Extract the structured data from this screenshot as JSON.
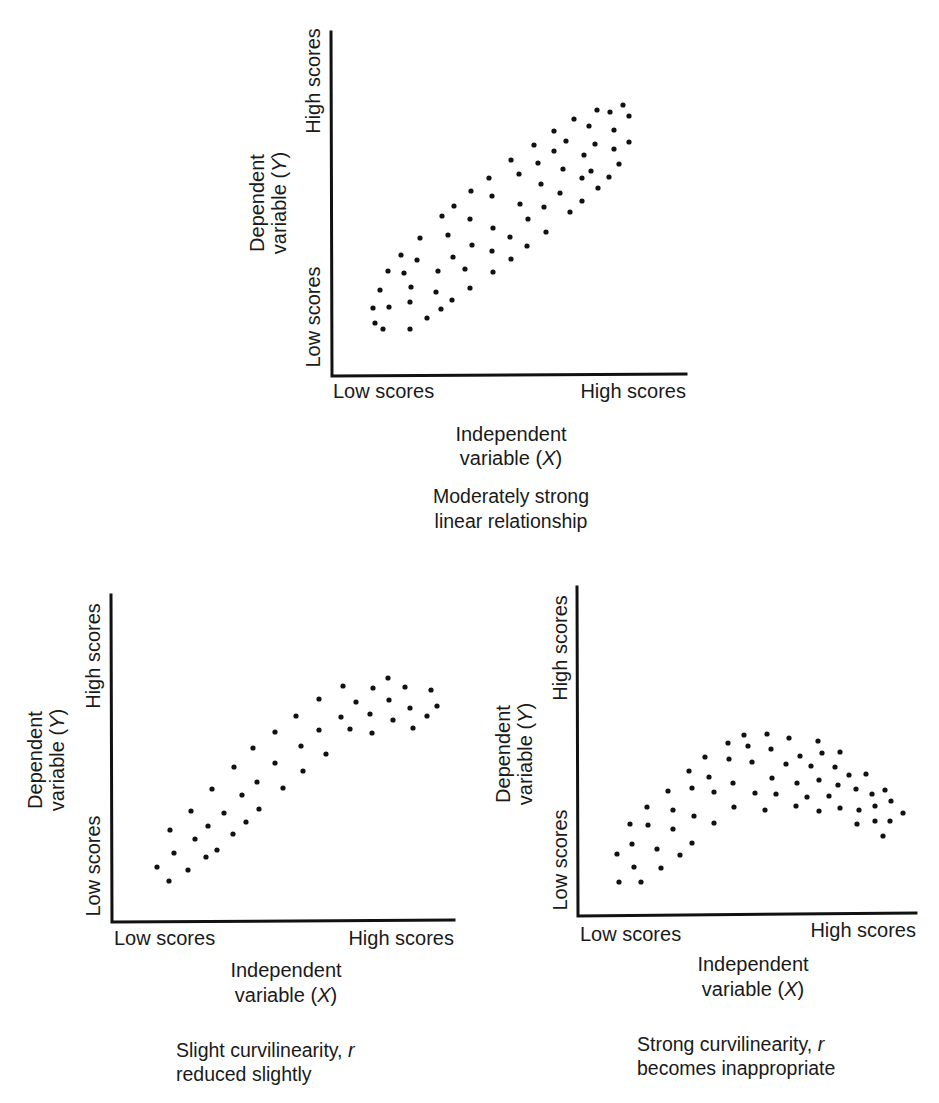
{
  "figure": {
    "panels": [
      {
        "id": "top",
        "caption_lines": [
          "Moderately strong",
          "linear relationship"
        ],
        "x_title_lines": [
          "Independent",
          "variable (",
          "X",
          ")"
        ],
        "y_title_lines": [
          "Dependent",
          "variable (",
          "Y",
          ")"
        ],
        "x_low": "Low scores",
        "x_high": "High scores",
        "y_low": "Low scores",
        "y_high": "High scores"
      },
      {
        "id": "bottom-left",
        "caption_lines": [
          "Slight curvilinearity, ",
          "r",
          "reduced slightly"
        ],
        "x_title_lines": [
          "Independent",
          "variable (",
          "X",
          ")"
        ],
        "y_title_lines": [
          "Dependent",
          "variable (",
          "Y",
          ")"
        ],
        "x_low": "Low scores",
        "x_high": "High scores",
        "y_low": "Low scores",
        "y_high": "High scores"
      },
      {
        "id": "bottom-right",
        "caption_lines": [
          "Strong curvilinearity, ",
          "r",
          "becomes inappropriate"
        ],
        "x_title_lines": [
          "Independent",
          "variable (",
          "X",
          ")"
        ],
        "y_title_lines": [
          "Dependent",
          "variable (",
          "Y",
          ")"
        ],
        "x_low": "Low scores",
        "x_high": "High scores",
        "y_low": "Low scores",
        "y_high": "High scores"
      }
    ]
  },
  "chart_data": [
    {
      "type": "scatter",
      "title": "Moderately strong linear relationship",
      "xlabel": "Independent variable (X)",
      "ylabel": "Dependent variable (Y)",
      "x_ticks": [
        "Low scores",
        "High scores"
      ],
      "y_ticks": [
        "Low scores",
        "High scores"
      ],
      "grid": false,
      "frame_px": {
        "x0": 331,
        "y0": 376,
        "x1": 686,
        "y1": 31
      },
      "points_px": [
        [
          373,
          308
        ],
        [
          375,
          323
        ],
        [
          383,
          329
        ],
        [
          380,
          290
        ],
        [
          389,
          307
        ],
        [
          388,
          271
        ],
        [
          401,
          255
        ],
        [
          404,
          273
        ],
        [
          411,
          287
        ],
        [
          410,
          302
        ],
        [
          410,
          329
        ],
        [
          417,
          260
        ],
        [
          420,
          238
        ],
        [
          427,
          318
        ],
        [
          438,
          271
        ],
        [
          436,
          292
        ],
        [
          441,
          309
        ],
        [
          442,
          216
        ],
        [
          448,
          235
        ],
        [
          452,
          300
        ],
        [
          453,
          257
        ],
        [
          454,
          206
        ],
        [
          465,
          269
        ],
        [
          470,
          219
        ],
        [
          470,
          288
        ],
        [
          472,
          245
        ],
        [
          471,
          191
        ],
        [
          489,
          178
        ],
        [
          492,
          196
        ],
        [
          492,
          251
        ],
        [
          493,
          272
        ],
        [
          493,
          228
        ],
        [
          510,
          237
        ],
        [
          511,
          259
        ],
        [
          511,
          160
        ],
        [
          519,
          174
        ],
        [
          520,
          204
        ],
        [
          527,
          246
        ],
        [
          528,
          219
        ],
        [
          534,
          145
        ],
        [
          538,
          163
        ],
        [
          541,
          184
        ],
        [
          544,
          207
        ],
        [
          546,
          232
        ],
        [
          554,
          131
        ],
        [
          554,
          151
        ],
        [
          560,
          193
        ],
        [
          563,
          169
        ],
        [
          566,
          141
        ],
        [
          570,
          212
        ],
        [
          574,
          119
        ],
        [
          582,
          201
        ],
        [
          582,
          178
        ],
        [
          584,
          155
        ],
        [
          589,
          126
        ],
        [
          591,
          171
        ],
        [
          595,
          144
        ],
        [
          597,
          110
        ],
        [
          598,
          188
        ],
        [
          609,
          177
        ],
        [
          610,
          112
        ],
        [
          614,
          130
        ],
        [
          614,
          149
        ],
        [
          619,
          164
        ],
        [
          623,
          105
        ],
        [
          629,
          116
        ],
        [
          629,
          142
        ]
      ]
    },
    {
      "type": "scatter",
      "title": "Slight curvilinearity, r reduced slightly",
      "xlabel": "Independent variable (X)",
      "ylabel": "Dependent variable (Y)",
      "x_ticks": [
        "Low scores",
        "High scores"
      ],
      "y_ticks": [
        "Low scores",
        "High scores"
      ],
      "grid": false,
      "frame_px": {
        "x0": 112,
        "y0": 922,
        "x1": 454,
        "y1": 594
      },
      "points_px": [
        [
          157,
          867
        ],
        [
          169,
          881
        ],
        [
          174,
          853
        ],
        [
          170,
          830
        ],
        [
          188,
          870
        ],
        [
          195,
          839
        ],
        [
          191,
          811
        ],
        [
          206,
          857
        ],
        [
          208,
          826
        ],
        [
          217,
          850
        ],
        [
          212,
          789
        ],
        [
          224,
          813
        ],
        [
          233,
          834
        ],
        [
          234,
          767
        ],
        [
          242,
          795
        ],
        [
          246,
          822
        ],
        [
          259,
          809
        ],
        [
          253,
          748
        ],
        [
          257,
          782
        ],
        [
          275,
          732
        ],
        [
          275,
          763
        ],
        [
          283,
          788
        ],
        [
          296,
          716
        ],
        [
          301,
          746
        ],
        [
          303,
          771
        ],
        [
          319,
          699
        ],
        [
          319,
          730
        ],
        [
          326,
          754
        ],
        [
          343,
          686
        ],
        [
          341,
          717
        ],
        [
          350,
          729
        ],
        [
          356,
          702
        ],
        [
          373,
          688
        ],
        [
          370,
          714
        ],
        [
          372,
          733
        ],
        [
          388,
          678
        ],
        [
          389,
          700
        ],
        [
          393,
          720
        ],
        [
          405,
          687
        ],
        [
          410,
          708
        ],
        [
          413,
          728
        ],
        [
          431,
          690
        ],
        [
          437,
          706
        ],
        [
          427,
          716
        ]
      ]
    },
    {
      "type": "scatter",
      "title": "Strong curvilinearity, r becomes inappropriate",
      "xlabel": "Independent variable (X)",
      "ylabel": "Dependent variable (Y)",
      "x_ticks": [
        "Low scores",
        "High scores"
      ],
      "y_ticks": [
        "Low scores",
        "High scores"
      ],
      "grid": false,
      "frame_px": {
        "x0": 578,
        "y0": 916,
        "x1": 916,
        "y1": 586
      },
      "points_px": [
        [
          619,
          882
        ],
        [
          641,
          882
        ],
        [
          617,
          854
        ],
        [
          634,
          867
        ],
        [
          632,
          844
        ],
        [
          630,
          824
        ],
        [
          647,
          807
        ],
        [
          648,
          825
        ],
        [
          657,
          849
        ],
        [
          661,
          868
        ],
        [
          668,
          791
        ],
        [
          673,
          810
        ],
        [
          673,
          829
        ],
        [
          680,
          855
        ],
        [
          692,
          843
        ],
        [
          694,
          816
        ],
        [
          689,
          771
        ],
        [
          692,
          788
        ],
        [
          705,
          757
        ],
        [
          709,
          777
        ],
        [
          714,
          792
        ],
        [
          714,
          823
        ],
        [
          728,
          743
        ],
        [
          729,
          759
        ],
        [
          733,
          783
        ],
        [
          734,
          807
        ],
        [
          744,
          735
        ],
        [
          748,
          746
        ],
        [
          752,
          762
        ],
        [
          755,
          793
        ],
        [
          765,
          810
        ],
        [
          767,
          734
        ],
        [
          771,
          749
        ],
        [
          772,
          778
        ],
        [
          776,
          794
        ],
        [
          789,
          738
        ],
        [
          786,
          764
        ],
        [
          796,
          806
        ],
        [
          797,
          783
        ],
        [
          800,
          756
        ],
        [
          807,
          797
        ],
        [
          811,
          766
        ],
        [
          818,
          741
        ],
        [
          819,
          780
        ],
        [
          822,
          753
        ],
        [
          819,
          811
        ],
        [
          829,
          796
        ],
        [
          835,
          767
        ],
        [
          838,
          785
        ],
        [
          840,
          808
        ],
        [
          840,
          752
        ],
        [
          849,
          775
        ],
        [
          856,
          789
        ],
        [
          859,
          810
        ],
        [
          857,
          824
        ],
        [
          866,
          774
        ],
        [
          872,
          794
        ],
        [
          875,
          806
        ],
        [
          875,
          821
        ],
        [
          885,
          790
        ],
        [
          891,
          801
        ],
        [
          890,
          821
        ],
        [
          883,
          836
        ],
        [
          903,
          813
        ]
      ]
    }
  ]
}
